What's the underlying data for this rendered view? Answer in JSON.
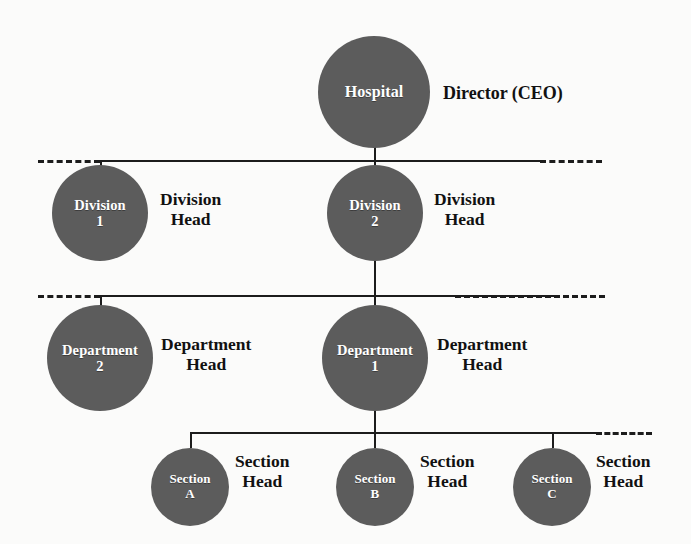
{
  "diagram": {
    "type": "hospital-organizational-chart",
    "background_color": "#fbfbfa",
    "node_color": "#5c5c5c",
    "node_text_color": "#ffffff",
    "line_color": "#1c1c1c",
    "label_color": "#111111"
  },
  "levels": [
    {
      "id": "level-director",
      "nodes": [
        {
          "id": "hospital",
          "line1": "Hospital",
          "line2": "",
          "role_line1": "Director (CEO)",
          "role_line2": ""
        }
      ]
    },
    {
      "id": "level-division",
      "nodes": [
        {
          "id": "division-1",
          "line1": "Division",
          "line2": "1",
          "role_line1": "Division",
          "role_line2": "Head"
        },
        {
          "id": "division-2",
          "line1": "Division",
          "line2": "2",
          "role_line1": "Division",
          "role_line2": "Head"
        }
      ]
    },
    {
      "id": "level-department",
      "nodes": [
        {
          "id": "department-2",
          "line1": "Department",
          "line2": "2",
          "role_line1": "Department",
          "role_line2": "Head"
        },
        {
          "id": "department-1",
          "line1": "Department",
          "line2": "1",
          "role_line1": "Department",
          "role_line2": "Head"
        }
      ]
    },
    {
      "id": "level-section",
      "nodes": [
        {
          "id": "section-a",
          "line1": "Section",
          "line2": "A",
          "role_line1": "Section",
          "role_line2": "Head"
        },
        {
          "id": "section-b",
          "line1": "Section",
          "line2": "B",
          "role_line1": "Section",
          "role_line2": "Head"
        },
        {
          "id": "section-c",
          "line1": "Section",
          "line2": "C",
          "role_line1": "Section",
          "role_line2": "Head"
        }
      ]
    }
  ]
}
